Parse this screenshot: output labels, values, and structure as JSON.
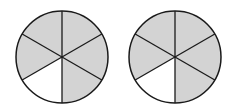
{
  "figure": {
    "colors": {
      "shaded": "#d3d3d3",
      "unshaded": "#ffffff",
      "stroke": "#1a1a1a"
    },
    "circles": [
      {
        "id": "circle-1",
        "cx": 62,
        "cy": 57,
        "r": 46,
        "parts": 6,
        "shaded_parts": 5,
        "unshaded_sector_index": 3
      },
      {
        "id": "circle-2",
        "cx": 175,
        "cy": 57,
        "r": 46,
        "parts": 6,
        "shaded_parts": 5,
        "unshaded_sector_index": 3
      }
    ]
  }
}
